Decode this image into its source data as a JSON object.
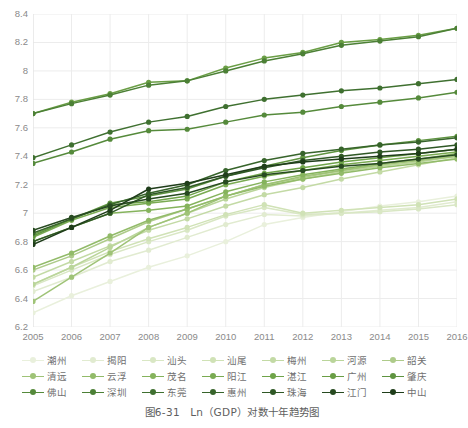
{
  "caption": "图6-31　Ln（GDP）对数十年趋势图",
  "axes": {
    "y_ticks": [
      "6.2",
      "6.4",
      "6.6",
      "6.8",
      "7",
      "7.2",
      "7.4",
      "7.6",
      "7.8",
      "8",
      "8.2",
      "8.4"
    ],
    "x_ticks": [
      "2005",
      "2006",
      "2007",
      "2008",
      "2009",
      "2010",
      "2011",
      "2012",
      "2013",
      "2014",
      "2015",
      "2016"
    ]
  },
  "chart_data": {
    "type": "line",
    "title": "图6-31　Ln（GDP）对数十年趋势图",
    "xlabel": "",
    "ylabel": "",
    "xlim": [
      2005,
      2016
    ],
    "ylim": [
      6.2,
      8.4
    ],
    "ytick_step": 0.2,
    "grid": true,
    "legend_position": "bottom",
    "legend_columns": 7,
    "legend_rows": 3,
    "x": [
      2005,
      2006,
      2007,
      2008,
      2009,
      2010,
      2011,
      2012,
      2013,
      2014,
      2015,
      2016
    ],
    "categories": [
      "2005",
      "2006",
      "2007",
      "2008",
      "2009",
      "2010",
      "2011",
      "2012",
      "2013",
      "2014",
      "2015",
      "2016"
    ],
    "series": [
      {
        "name": "潮州",
        "color": "#e9f0dc",
        "values": [
          6.3,
          6.42,
          6.52,
          6.62,
          6.7,
          6.8,
          6.92,
          6.97,
          7.01,
          7.05,
          7.08,
          7.12
        ]
      },
      {
        "name": "揭阳",
        "color": "#e1ebd0",
        "values": [
          6.45,
          6.55,
          6.66,
          6.74,
          6.83,
          6.92,
          6.99,
          6.98,
          7.0,
          7.02,
          7.04,
          7.08
        ]
      },
      {
        "name": "汕头",
        "color": "#d9e7c4",
        "values": [
          6.49,
          6.6,
          6.71,
          6.8,
          6.88,
          6.98,
          7.04,
          6.99,
          7.0,
          7.01,
          7.03,
          7.06
        ]
      },
      {
        "name": "汕尾",
        "color": "#d0e2b6",
        "values": [
          6.5,
          6.62,
          6.73,
          6.82,
          6.9,
          6.99,
          7.06,
          7.0,
          7.02,
          7.04,
          7.06,
          7.1
        ]
      },
      {
        "name": "梅州",
        "color": "#c3daa5",
        "values": [
          6.55,
          6.66,
          6.77,
          6.88,
          6.96,
          7.05,
          7.13,
          7.18,
          7.24,
          7.29,
          7.34,
          7.39
        ]
      },
      {
        "name": "河源",
        "color": "#bad59a",
        "values": [
          6.5,
          6.62,
          6.76,
          6.9,
          7.0,
          7.1,
          7.18,
          7.24,
          7.29,
          7.33,
          7.36,
          7.4
        ]
      },
      {
        "name": "韶关",
        "color": "#aecb8a",
        "values": [
          6.6,
          6.7,
          6.82,
          6.94,
          7.03,
          7.12,
          7.2,
          7.25,
          7.3,
          7.34,
          7.37,
          7.41
        ]
      },
      {
        "name": "清远",
        "color": "#9fc377",
        "values": [
          6.38,
          6.55,
          6.72,
          6.9,
          7.0,
          7.12,
          7.2,
          7.26,
          7.3,
          7.34,
          7.37,
          7.4
        ]
      },
      {
        "name": "云浮",
        "color": "#92bb69",
        "values": [
          6.62,
          6.72,
          6.84,
          6.95,
          7.03,
          7.12,
          7.19,
          7.24,
          7.28,
          7.32,
          7.35,
          7.38
        ]
      },
      {
        "name": "茂名",
        "color": "#85b35c",
        "values": [
          6.8,
          6.9,
          7.0,
          7.02,
          7.05,
          7.15,
          7.22,
          7.27,
          7.31,
          7.35,
          7.38,
          7.42
        ]
      },
      {
        "name": "阳江",
        "color": "#7aab52",
        "values": [
          6.83,
          6.95,
          7.04,
          7.07,
          7.1,
          7.2,
          7.26,
          7.3,
          7.34,
          7.37,
          7.4,
          7.43
        ]
      },
      {
        "name": "湛江",
        "color": "#6fa449",
        "values": [
          6.85,
          6.96,
          7.06,
          7.08,
          7.12,
          7.22,
          7.28,
          7.32,
          7.36,
          7.39,
          7.42,
          7.45
        ]
      },
      {
        "name": "广州",
        "color": "#6a9e45",
        "values": [
          7.7,
          7.78,
          7.84,
          7.92,
          7.93,
          8.02,
          8.09,
          8.13,
          8.2,
          8.22,
          8.25,
          8.3
        ]
      },
      {
        "name": "肇庆",
        "color": "#5f9440",
        "values": [
          6.84,
          6.96,
          7.07,
          7.12,
          7.17,
          7.26,
          7.33,
          7.39,
          7.44,
          7.48,
          7.51,
          7.54
        ]
      },
      {
        "name": "佛山",
        "color": "#558a3b",
        "values": [
          7.35,
          7.43,
          7.52,
          7.58,
          7.59,
          7.64,
          7.69,
          7.71,
          7.75,
          7.78,
          7.81,
          7.85
        ]
      },
      {
        "name": "深圳",
        "color": "#4c8036",
        "values": [
          7.7,
          7.77,
          7.83,
          7.9,
          7.93,
          8.0,
          8.07,
          8.12,
          8.18,
          8.21,
          8.24,
          8.3
        ]
      },
      {
        "name": "东莞",
        "color": "#3f7030",
        "values": [
          7.39,
          7.48,
          7.57,
          7.64,
          7.68,
          7.75,
          7.8,
          7.83,
          7.86,
          7.88,
          7.91,
          7.94
        ]
      },
      {
        "name": "惠州",
        "color": "#37642b",
        "values": [
          6.86,
          6.96,
          7.06,
          7.14,
          7.2,
          7.3,
          7.37,
          7.42,
          7.45,
          7.48,
          7.5,
          7.53
        ]
      },
      {
        "name": "珠海",
        "color": "#2f5825",
        "values": [
          6.8,
          6.9,
          7.0,
          7.13,
          7.18,
          7.26,
          7.32,
          7.37,
          7.4,
          7.43,
          7.45,
          7.48
        ]
      },
      {
        "name": "江门",
        "color": "#274a20",
        "values": [
          6.88,
          6.97,
          7.05,
          7.1,
          7.14,
          7.22,
          7.27,
          7.3,
          7.33,
          7.35,
          7.38,
          7.41
        ]
      },
      {
        "name": "中山",
        "color": "#1f3d1a",
        "values": [
          6.78,
          6.9,
          7.02,
          7.17,
          7.21,
          7.27,
          7.33,
          7.36,
          7.38,
          7.4,
          7.42,
          7.45
        ]
      }
    ]
  },
  "legend": {
    "rows": [
      [
        "潮州",
        "揭阳",
        "汕头",
        "汕尾",
        "梅州",
        "河源",
        "韶关"
      ],
      [
        "清远",
        "云浮",
        "茂名",
        "阳江",
        "湛江",
        "广州",
        "肇庆"
      ],
      [
        "佛山",
        "深圳",
        "东莞",
        "惠州",
        "珠海",
        "江门",
        "中山"
      ]
    ]
  }
}
